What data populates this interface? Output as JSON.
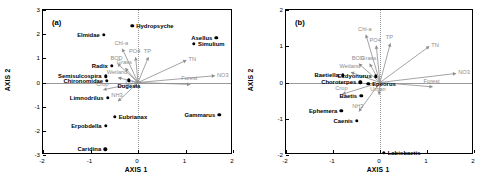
{
  "figure": {
    "panels": [
      {
        "tag": "(a)",
        "xlabel": "AXIS 1",
        "ylabel": "AXIS 2",
        "xticks": [
          "-2",
          "-1",
          "0",
          "1",
          "2"
        ],
        "yticks": [
          "3",
          "2",
          "1",
          "0",
          "-1",
          "-2",
          "-3"
        ],
        "xlim": [
          -2,
          2
        ],
        "ylim": [
          -3,
          3
        ]
      },
      {
        "tag": "(b)",
        "xlabel": "AXIS 1",
        "ylabel": "AXIS 2",
        "xticks": [
          "-2",
          "-1",
          "0",
          "1",
          "2"
        ],
        "yticks": [
          "2",
          "1",
          "0",
          "-1",
          "-2"
        ],
        "xlim": [
          -2,
          2
        ],
        "ylim": [
          -2,
          2
        ]
      }
    ]
  },
  "chart_data": [
    {
      "type": "scatter",
      "title": "(a)",
      "xlabel": "AXIS 1",
      "ylabel": "AXIS 2",
      "xlim": [
        -2,
        2
      ],
      "ylim": [
        -3,
        3
      ],
      "grid": false,
      "legend": "none",
      "marker_color": "#000000",
      "vector_color": "#8d8d8d",
      "species_points": [
        {
          "label": "Elmidae",
          "x": -0.7,
          "y": 1.92,
          "label_pos": "r"
        },
        {
          "label": "Hydropsyche",
          "x": -0.1,
          "y": 2.3,
          "label_pos": "l"
        },
        {
          "label": "Asellus",
          "x": 1.67,
          "y": 1.82,
          "label_pos": "r"
        },
        {
          "label": "Simulium",
          "x": 1.2,
          "y": 1.57,
          "label_pos": "l"
        },
        {
          "label": "Radix",
          "x": -0.53,
          "y": 0.66,
          "label_pos": "r"
        },
        {
          "label": "Semisulcospira",
          "x": -0.66,
          "y": 0.22,
          "label_pos": "r"
        },
        {
          "label": "Chironomidae",
          "x": -0.63,
          "y": 0.02,
          "label_pos": "r"
        },
        {
          "label": "Dugesia",
          "x": -0.17,
          "y": 0.05,
          "label_pos": "c"
        },
        {
          "label": "Limnodrilus",
          "x": -0.62,
          "y": -0.68,
          "label_pos": "r"
        },
        {
          "label": "Eubrianax",
          "x": -0.47,
          "y": -1.45,
          "label_pos": "l"
        },
        {
          "label": "Erpobdella",
          "x": -0.66,
          "y": -1.83,
          "label_pos": "r"
        },
        {
          "label": "Caridina",
          "x": -0.67,
          "y": -2.8,
          "label_pos": "r"
        },
        {
          "label": "Gammarus",
          "x": 1.73,
          "y": -1.38,
          "label_pos": "r"
        }
      ],
      "env_vectors": [
        {
          "label": "Chl-a",
          "x": -0.33,
          "y": 1.4,
          "label_pos": "c"
        },
        {
          "label": "PO4",
          "x": -0.05,
          "y": 1.05,
          "label_pos": "c"
        },
        {
          "label": "TP",
          "x": 0.22,
          "y": 1.05,
          "label_pos": "c"
        },
        {
          "label": "TN",
          "x": 1.02,
          "y": 0.92,
          "label_pos": "l"
        },
        {
          "label": "NO3",
          "x": 1.62,
          "y": 0.28,
          "label_pos": "l"
        },
        {
          "label": "Forest",
          "x": 1.1,
          "y": -0.08,
          "label_pos": "c"
        },
        {
          "label": "BOD",
          "x": -0.43,
          "y": 0.78,
          "label_pos": "c"
        },
        {
          "label": "Grass",
          "x": -0.27,
          "y": 0.6,
          "label_pos": "c"
        },
        {
          "label": "Wetland",
          "x": -0.42,
          "y": 0.2,
          "label_pos": "c"
        },
        {
          "label": "Crop",
          "x": -0.73,
          "y": -0.3,
          "label_pos": "c"
        },
        {
          "label": "Urban",
          "x": -0.08,
          "y": -0.22,
          "label_pos": "c"
        },
        {
          "label": "NH3",
          "x": -0.42,
          "y": -0.78,
          "label_pos": "c"
        }
      ]
    },
    {
      "type": "scatter",
      "title": "(b)",
      "xlabel": "AXIS 1",
      "ylabel": "AXIS 2",
      "xlim": [
        -2,
        2
      ],
      "ylim": [
        -2,
        2
      ],
      "grid": false,
      "legend": "none",
      "marker_color": "#000000",
      "vector_color": "#8d8d8d",
      "species_points": [
        {
          "label": "Baetiella",
          "x": -0.77,
          "y": 0.17,
          "label_pos": "r"
        },
        {
          "label": "Ecdyonurus",
          "x": -0.07,
          "y": 0.14,
          "label_pos": "r"
        },
        {
          "label": "Choroterpes",
          "x": -0.4,
          "y": -0.02,
          "label_pos": "r"
        },
        {
          "label": "Epeorus",
          "x": -0.23,
          "y": -0.06,
          "label_pos": "l"
        },
        {
          "label": "Baetis",
          "x": -0.38,
          "y": -0.4,
          "label_pos": "r"
        },
        {
          "label": "Ephemera",
          "x": -0.8,
          "y": -0.8,
          "label_pos": "r"
        },
        {
          "label": "Caenis",
          "x": -0.47,
          "y": -1.08,
          "label_pos": "r"
        },
        {
          "label": "Labiobaetis",
          "x": 0.1,
          "y": -1.97,
          "label_pos": "l"
        }
      ],
      "env_vectors": [
        {
          "label": "Chl-a",
          "x": -0.3,
          "y": 1.32,
          "label_pos": "c"
        },
        {
          "label": "PO4",
          "x": -0.08,
          "y": 1.02,
          "label_pos": "c"
        },
        {
          "label": "TP",
          "x": 0.22,
          "y": 1.08,
          "label_pos": "c"
        },
        {
          "label": "TN",
          "x": 1.05,
          "y": 1.0,
          "label_pos": "l"
        },
        {
          "label": "NO3",
          "x": 1.62,
          "y": 0.25,
          "label_pos": "l"
        },
        {
          "label": "Forest",
          "x": 1.12,
          "y": -0.12,
          "label_pos": "c"
        },
        {
          "label": "BOD",
          "x": -0.45,
          "y": 0.52,
          "label_pos": "c"
        },
        {
          "label": "Grass",
          "x": -0.22,
          "y": 0.52,
          "label_pos": "c"
        },
        {
          "label": "Wetland",
          "x": -0.62,
          "y": 0.28,
          "label_pos": "c"
        },
        {
          "label": "Crop",
          "x": -0.8,
          "y": -0.32,
          "label_pos": "c"
        },
        {
          "label": "Urban",
          "x": -0.02,
          "y": -0.34,
          "label_pos": "c"
        },
        {
          "label": "NH3",
          "x": -0.45,
          "y": -0.8,
          "label_pos": "c"
        }
      ]
    }
  ]
}
